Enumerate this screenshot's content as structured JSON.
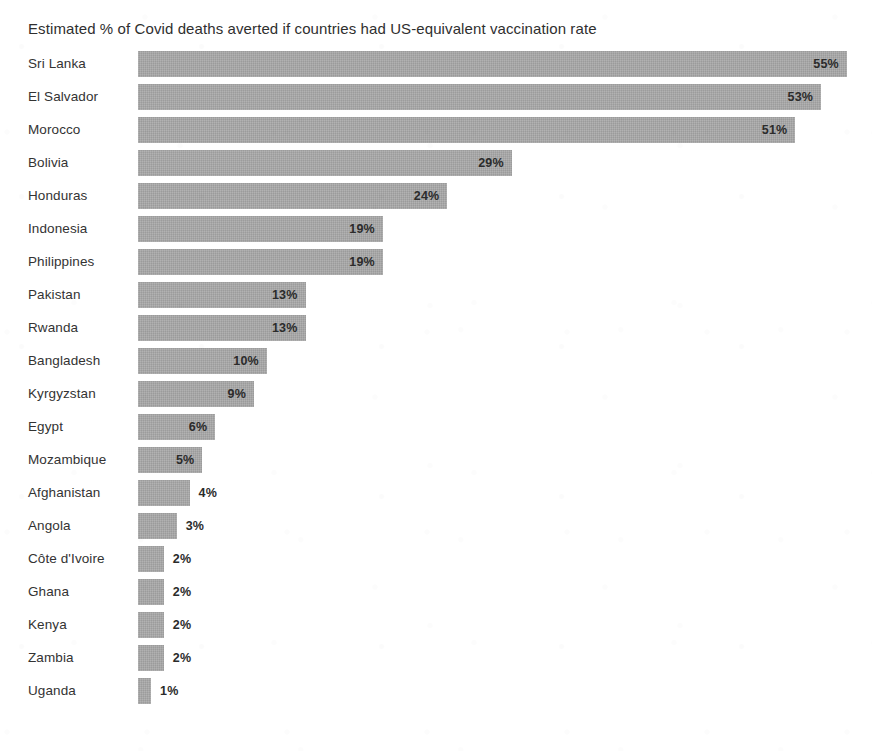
{
  "chart_data": {
    "type": "bar",
    "orientation": "horizontal",
    "title": "Estimated % of Covid deaths averted if countries had US-equivalent vaccination rate",
    "xlabel": "",
    "ylabel": "",
    "xlim": [
      0,
      55
    ],
    "grid": false,
    "legend": false,
    "value_suffix": "%",
    "bar_color": "#a9a9a9",
    "text_color": "#333333",
    "background_color": "#ffffff",
    "categories": [
      "Sri Lanka",
      "El Salvador",
      "Morocco",
      "Bolivia",
      "Honduras",
      "Indonesia",
      "Philippines",
      "Pakistan",
      "Rwanda",
      "Bangladesh",
      "Kyrgyzstan",
      "Egypt",
      "Mozambique",
      "Afghanistan",
      "Angola",
      "Côte d'Ivoire",
      "Ghana",
      "Kenya",
      "Zambia",
      "Uganda"
    ],
    "values": [
      55,
      53,
      51,
      29,
      24,
      19,
      19,
      13,
      13,
      10,
      9,
      6,
      5,
      4,
      3,
      2,
      2,
      2,
      2,
      1
    ],
    "value_labels": [
      "55%",
      "53%",
      "51%",
      "29%",
      "24%",
      "19%",
      "19%",
      "13%",
      "13%",
      "10%",
      "9%",
      "6%",
      "5%",
      "4%",
      "3%",
      "2%",
      "2%",
      "2%",
      "2%",
      "1%"
    ],
    "rows": [
      {
        "label": "Sri Lanka",
        "value": 55,
        "value_label": "55%",
        "label_position": "inside"
      },
      {
        "label": "El Salvador",
        "value": 53,
        "value_label": "53%",
        "label_position": "inside"
      },
      {
        "label": "Morocco",
        "value": 51,
        "value_label": "51%",
        "label_position": "inside"
      },
      {
        "label": "Bolivia",
        "value": 29,
        "value_label": "29%",
        "label_position": "inside"
      },
      {
        "label": "Honduras",
        "value": 24,
        "value_label": "24%",
        "label_position": "inside"
      },
      {
        "label": "Indonesia",
        "value": 19,
        "value_label": "19%",
        "label_position": "inside"
      },
      {
        "label": "Philippines",
        "value": 19,
        "value_label": "19%",
        "label_position": "inside"
      },
      {
        "label": "Pakistan",
        "value": 13,
        "value_label": "13%",
        "label_position": "inside"
      },
      {
        "label": "Rwanda",
        "value": 13,
        "value_label": "13%",
        "label_position": "inside"
      },
      {
        "label": "Bangladesh",
        "value": 10,
        "value_label": "10%",
        "label_position": "inside"
      },
      {
        "label": "Kyrgyzstan",
        "value": 9,
        "value_label": "9%",
        "label_position": "inside"
      },
      {
        "label": "Egypt",
        "value": 6,
        "value_label": "6%",
        "label_position": "inside"
      },
      {
        "label": "Mozambique",
        "value": 5,
        "value_label": "5%",
        "label_position": "inside"
      },
      {
        "label": "Afghanistan",
        "value": 4,
        "value_label": "4%",
        "label_position": "outside"
      },
      {
        "label": "Angola",
        "value": 3,
        "value_label": "3%",
        "label_position": "outside"
      },
      {
        "label": "Côte d'Ivoire",
        "value": 2,
        "value_label": "2%",
        "label_position": "outside"
      },
      {
        "label": "Ghana",
        "value": 2,
        "value_label": "2%",
        "label_position": "outside"
      },
      {
        "label": "Kenya",
        "value": 2,
        "value_label": "2%",
        "label_position": "outside"
      },
      {
        "label": "Zambia",
        "value": 2,
        "value_label": "2%",
        "label_position": "outside"
      },
      {
        "label": "Uganda",
        "value": 1,
        "value_label": "1%",
        "label_position": "outside"
      }
    ]
  },
  "layout": {
    "px_per_percent": 12.89,
    "min_bar_px": 13,
    "bar_height_px": 26,
    "row_gap_px": 7,
    "plot_left_px": 138
  }
}
